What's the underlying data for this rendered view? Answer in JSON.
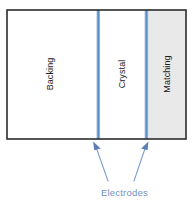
{
  "diagram": {
    "layers": [
      {
        "id": "backing",
        "label": "Backing",
        "fill": "#ffffff"
      },
      {
        "id": "crystal",
        "label": "Crystal",
        "fill": "#ffffff"
      },
      {
        "id": "matching",
        "label": "Matching",
        "fill": "#e9e9e9"
      }
    ],
    "electrodes": {
      "label": "Electrodes",
      "color": "#6f92c4",
      "count": 2
    },
    "colors": {
      "electrode_line": "#5b8ec7",
      "electrode_line_edge": "#a8c3e0",
      "border": "#2b2b2b",
      "matching_fill": "#e9e9e9",
      "body_fill": "#ffffff",
      "label_text": "#1c1c1c",
      "annotation_text": "#6f92c4",
      "arrow": "#7f9fcc"
    }
  }
}
